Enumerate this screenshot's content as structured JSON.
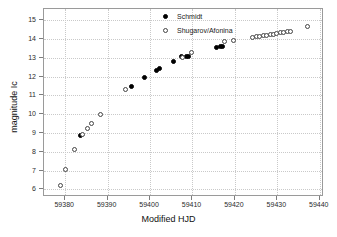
{
  "chart_data": {
    "type": "scatter",
    "title": "",
    "xlabel": "Modified HJD",
    "ylabel": "magnitude Ic",
    "xlim": [
      59375,
      59441
    ],
    "ylim": [
      15.6,
      5.6
    ],
    "y_inverted": true,
    "grid": true,
    "legend_position": "top-right",
    "xticks": [
      59380,
      59390,
      59400,
      59410,
      59420,
      59430,
      59440
    ],
    "xtick_labels": [
      "59380",
      "59390",
      "59400",
      "59410",
      "59420",
      "59430",
      "59440"
    ],
    "yticks": [
      6,
      7,
      8,
      9,
      10,
      11,
      12,
      13,
      14,
      15
    ],
    "ytick_labels": [
      "6",
      "7",
      "8",
      "9",
      "10",
      "11",
      "12",
      "13",
      "14",
      "15"
    ],
    "series": [
      {
        "name": "Schmidt",
        "marker": "filled-circle",
        "color": "#000000",
        "points": [
          [
            59383.6,
            8.85
          ],
          [
            59395.6,
            11.5
          ],
          [
            59398.7,
            11.95
          ],
          [
            59401.6,
            12.35
          ],
          [
            59402.2,
            12.45
          ],
          [
            59405.6,
            12.8
          ],
          [
            59407.4,
            13.05
          ],
          [
            59408.6,
            13.1
          ],
          [
            59409.0,
            13.1
          ],
          [
            59415.6,
            13.55
          ],
          [
            59416.5,
            13.6
          ],
          [
            59417.0,
            13.62
          ]
        ]
      },
      {
        "name": "Shugarov/Afonina",
        "marker": "open-circle",
        "color": "#444444",
        "points": [
          [
            59379.0,
            6.2
          ],
          [
            59380.0,
            7.05
          ],
          [
            59382.3,
            8.15
          ],
          [
            59384.1,
            8.9
          ],
          [
            59385.3,
            9.25
          ],
          [
            59386.2,
            9.5
          ],
          [
            59388.3,
            10.0
          ],
          [
            59394.3,
            11.3
          ],
          [
            59407.6,
            13.0
          ],
          [
            59409.8,
            13.3
          ],
          [
            59417.6,
            13.85
          ],
          [
            59419.6,
            13.92
          ],
          [
            59424.2,
            14.1
          ],
          [
            59425.1,
            14.12
          ],
          [
            59425.9,
            14.15
          ],
          [
            59426.7,
            14.17
          ],
          [
            59427.5,
            14.2
          ],
          [
            59428.3,
            14.22
          ],
          [
            59429.1,
            14.26
          ],
          [
            59429.9,
            14.3
          ],
          [
            59430.7,
            14.33
          ],
          [
            59431.5,
            14.36
          ],
          [
            59432.3,
            14.4
          ],
          [
            59433.1,
            14.42
          ],
          [
            59437.2,
            14.65
          ]
        ]
      }
    ]
  }
}
